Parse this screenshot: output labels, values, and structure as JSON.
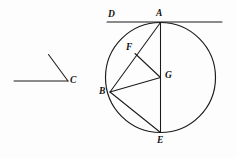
{
  "figure": {
    "background_color": "#fdfdfd",
    "stroke_color": "#1a1a1a",
    "width": 237,
    "height": 158,
    "labels": {
      "A": "A",
      "B": "B",
      "C": "C",
      "D": "D",
      "E": "E",
      "F": "F",
      "G": "G"
    },
    "points": {
      "A": {
        "x": 160.5,
        "y": 22.5,
        "label_x": 156,
        "label_y": 9,
        "role": "tangent-point-top-of-circle"
      },
      "B": {
        "x": 110.0,
        "y": 92.0,
        "label_x": 99,
        "label_y": 87,
        "role": "point-on-circle-left"
      },
      "C": {
        "x": 68.0,
        "y": 81.0,
        "label_x": 70,
        "label_y": 76,
        "role": "angle-vertex"
      },
      "D": {
        "x": 113.0,
        "y": 22.0,
        "label_x": 108,
        "label_y": 10,
        "role": "tangent-line-label"
      },
      "E": {
        "x": 160.5,
        "y": 132.5,
        "label_x": 157,
        "label_y": 136,
        "role": "point-on-circle-bottom"
      },
      "F": {
        "x": 135.0,
        "y": 53.5,
        "label_x": 126,
        "label_y": 43,
        "role": "point-on-chord-AB"
      },
      "G": {
        "x": 160.5,
        "y": 77.5,
        "label_x": 165,
        "label_y": 71,
        "role": "circle-center"
      }
    },
    "circle": {
      "center_x": 160.5,
      "center_y": 77.5,
      "radius": 55.0
    },
    "tangent_line": {
      "x1": 107.0,
      "y1": 22.0,
      "x2": 222.0,
      "y2": 22.0
    },
    "angle_figure": {
      "vertex_x": 68.0,
      "vertex_y": 81.0,
      "ray_horizontal_x": 14.0,
      "ray_horizontal_y": 81.0,
      "ray_upper_x": 48.5,
      "ray_upper_y": 54.5
    },
    "segments": [
      {
        "name": "chord-A-B",
        "x1": 160.5,
        "y1": 22.5,
        "x2": 110.0,
        "y2": 92.0
      },
      {
        "name": "diameter-A-E",
        "x1": 160.5,
        "y1": 22.5,
        "x2": 160.5,
        "y2": 132.5
      },
      {
        "name": "segment-F-G",
        "x1": 135.0,
        "y1": 53.5,
        "x2": 160.5,
        "y2": 77.5
      },
      {
        "name": "radius-B-G",
        "x1": 110.0,
        "y1": 92.0,
        "x2": 160.5,
        "y2": 77.5
      },
      {
        "name": "chord-B-E",
        "x1": 110.0,
        "y1": 92.0,
        "x2": 160.5,
        "y2": 132.5
      }
    ]
  }
}
